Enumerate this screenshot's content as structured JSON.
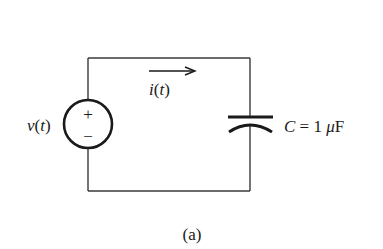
{
  "diagram": {
    "type": "circuit",
    "caption": "(a)",
    "source": {
      "kind": "voltage-source",
      "label_main": "v",
      "label_paren_open": "(",
      "label_arg": "t",
      "label_paren_close": ")",
      "plus_symbol": "+",
      "minus_symbol": "−"
    },
    "current": {
      "label_main": "i",
      "label_paren_open": "(",
      "label_arg": "t",
      "label_paren_close": ")",
      "direction": "right"
    },
    "capacitor": {
      "symbol": "C",
      "equals": " = 1 ",
      "unit_prefix": "μ",
      "unit": "F"
    },
    "colors": {
      "wire": "#3a3a3a",
      "ink": "#1a1a1a",
      "background": "#ffffff"
    }
  }
}
